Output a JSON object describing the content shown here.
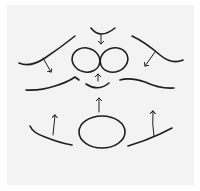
{
  "diagram": {
    "colors": {
      "ink": "#1e1e1e",
      "paper": "#f3f3f3",
      "background": "#ffffff"
    },
    "shapes": {
      "top_cup": "small U-shaped curve with downward arrow",
      "center_ovals": "two tilted ovals side by side",
      "left_upper_curve": "curved line with arrow pointing down-right",
      "right_upper_curve": "curved line with arrow pointing down-left",
      "left_lower_curve": "wavy line",
      "right_lower_curve": "wavy line",
      "middle_cup": "small U-shaped curve with upward arrow",
      "bottom_oval": "large horizontal oval with upward arrow above",
      "bottom_left_line": "slanted line with upward arrow",
      "bottom_right_line": "slanted line with upward arrow"
    }
  }
}
